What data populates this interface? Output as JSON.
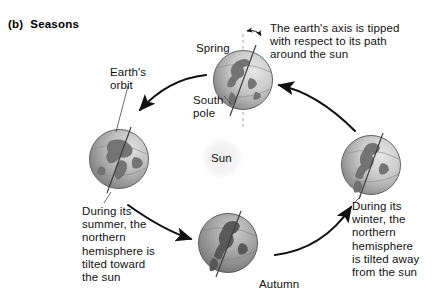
{
  "figure": {
    "caption_marker": "(b)",
    "caption_text": "Seasons"
  },
  "labels": {
    "spring": "Spring",
    "south_pole": "South\npole",
    "earths_orbit": "Earth's\norbit",
    "sun": "Sun",
    "autumn": "Autumn",
    "axis_note": "The earth's axis is tipped\nwith respect to its path\naround the sun",
    "summer_note": "During its\nsummer, the\nnorthern\nhemisphere is\ntilted toward\nthe sun",
    "winter_note": "During its\nwinter, the\nnorthern\nhemisphere\nis tilted away\nfrom the sun"
  },
  "colors": {
    "background": "#ffffff",
    "ink": "#1a1a1a",
    "globe_dark": "#8a8a8a",
    "globe_light": "#d9d9d9",
    "globe_outline": "#5a5a5a",
    "land": "#6e6e6e",
    "sun_glow": "#ebebeb",
    "axis_dash": "#9a9a9a"
  },
  "diagram": {
    "type": "orbit-seasons-diagram",
    "center_body": "Sun",
    "positions": [
      {
        "name": "Spring",
        "cx": 243,
        "cy": 80,
        "r": 30
      },
      {
        "name": "Summer",
        "cx": 119,
        "cy": 159,
        "r": 30
      },
      {
        "name": "Autumn",
        "cx": 228,
        "cy": 243,
        "r": 30
      },
      {
        "name": "Winter",
        "cx": 371,
        "cy": 165,
        "r": 30
      }
    ],
    "orbit_direction": "counterclockwise",
    "axis_tilt_indicator": "double-headed arc between vertical dashed line and tilted axis"
  }
}
